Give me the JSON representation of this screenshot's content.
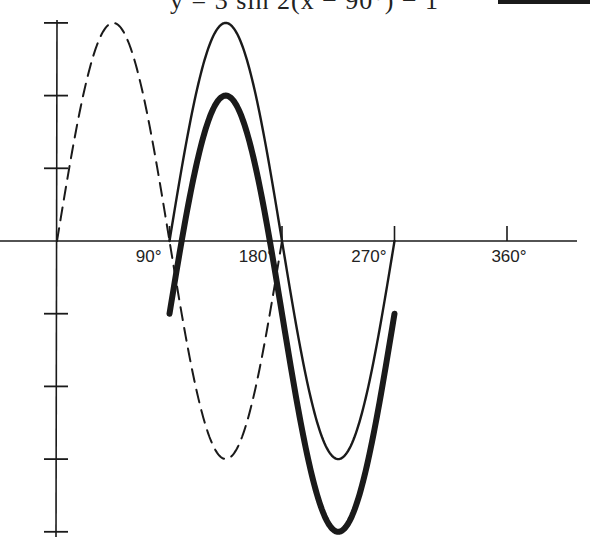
{
  "chart_data": {
    "type": "line",
    "title": "y = 3 sin 2(x − 90°) − 1",
    "xlabel": "",
    "ylabel": "",
    "x_unit": "degrees",
    "xlim": [
      0,
      360
    ],
    "ylim": [
      -4,
      3
    ],
    "x_ticks": [
      90,
      180,
      270,
      360
    ],
    "x_tick_labels": [
      "90°",
      "180°",
      "270°",
      "360°"
    ],
    "y_ticks": [
      3,
      2,
      1,
      -1,
      -2,
      -3,
      -4
    ],
    "y_tick_labels": [],
    "grid": false,
    "legend": {
      "position": "top-right",
      "entries": [
        {
          "label": "y = 3 sin 2(x − 90°) − 1",
          "style": "thick-solid"
        }
      ]
    },
    "series": [
      {
        "name": "y = 3 sin 2x",
        "style": "dashed",
        "amplitude": 3,
        "frequency": 2,
        "phase_shift_deg": 0,
        "vertical_shift": 0,
        "x_start": 0,
        "x_end": 180,
        "key_points": [
          [
            0,
            0
          ],
          [
            45,
            3
          ],
          [
            90,
            0
          ],
          [
            135,
            -3
          ],
          [
            180,
            0
          ]
        ]
      },
      {
        "name": "y = 3 sin 2(x − 90°)",
        "style": "thin-solid",
        "amplitude": 3,
        "frequency": 2,
        "phase_shift_deg": 90,
        "vertical_shift": 0,
        "x_start": 90,
        "x_end": 270,
        "key_points": [
          [
            90,
            0
          ],
          [
            135,
            3
          ],
          [
            180,
            0
          ],
          [
            225,
            -3
          ],
          [
            270,
            0
          ]
        ]
      },
      {
        "name": "y = 3 sin 2(x − 90°) − 1",
        "style": "thick-solid",
        "amplitude": 3,
        "frequency": 2,
        "phase_shift_deg": 90,
        "vertical_shift": -1,
        "x_start": 90,
        "x_end": 270,
        "key_points": [
          [
            90,
            -1
          ],
          [
            135,
            2
          ],
          [
            180,
            -1
          ],
          [
            225,
            -4
          ],
          [
            270,
            -1
          ]
        ]
      }
    ]
  },
  "header": {
    "equation": "y = 3 sin 2(x − 90°) − 1"
  },
  "colors": {
    "ink": "#1a1a1a",
    "background": "#ffffff"
  }
}
